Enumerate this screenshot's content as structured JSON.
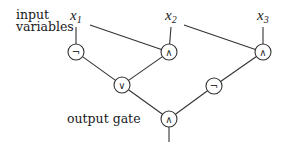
{
  "labels": {
    "inputs": [
      "input",
      "variables"
    ],
    "output": "output gate"
  },
  "variables": [
    {
      "id": "x1",
      "base": "x",
      "sub": "1"
    },
    {
      "id": "x2",
      "base": "x",
      "sub": "2"
    },
    {
      "id": "x3",
      "base": "x",
      "sub": "3"
    }
  ],
  "gates": [
    {
      "id": "g_not1",
      "type": "NOT",
      "symbol": "¬"
    },
    {
      "id": "g_and1",
      "type": "AND",
      "symbol": "∧"
    },
    {
      "id": "g_and2",
      "type": "AND",
      "symbol": "∧"
    },
    {
      "id": "g_or",
      "type": "OR",
      "symbol": "∨"
    },
    {
      "id": "g_not2",
      "type": "NOT",
      "symbol": "¬"
    },
    {
      "id": "g_out",
      "type": "AND",
      "symbol": "∧"
    }
  ],
  "edges": [
    [
      "x1",
      "g_not1"
    ],
    [
      "x1",
      "g_and1"
    ],
    [
      "x2",
      "g_and1"
    ],
    [
      "x2",
      "g_and2"
    ],
    [
      "x3",
      "g_and2"
    ],
    [
      "g_not1",
      "g_or"
    ],
    [
      "g_and1",
      "g_or"
    ],
    [
      "g_and2",
      "g_not2"
    ],
    [
      "g_or",
      "g_out"
    ],
    [
      "g_not2",
      "g_out"
    ]
  ]
}
